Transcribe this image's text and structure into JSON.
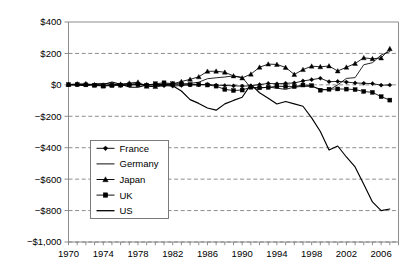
{
  "chart_data": {
    "type": "line",
    "title": "",
    "subtitle": "",
    "xlabel": "",
    "ylabel": "",
    "xlim": [
      1970,
      2008
    ],
    "ylim": [
      -1000,
      400
    ],
    "ytick_values": [
      400,
      200,
      0,
      -200,
      -400,
      -600,
      -800,
      -1000
    ],
    "ytick_labels": [
      "$400",
      "$200",
      "$0",
      "−$200",
      "−$400",
      "−$600",
      "−$800",
      "−$1,000"
    ],
    "xtick_labels": [
      "1970",
      "1974",
      "1978",
      "1982",
      "1986",
      "1990",
      "1994",
      "1998",
      "2002",
      "2006"
    ],
    "xtick_values": [
      1970,
      1974,
      1978,
      1982,
      1986,
      1990,
      1994,
      1998,
      2002,
      2006
    ],
    "minor_xtick_step": 1,
    "grid": "horizontal-dashed",
    "legend_position": "lower-left-inside",
    "x": [
      1970,
      1971,
      1972,
      1973,
      1974,
      1975,
      1976,
      1977,
      1978,
      1979,
      1980,
      1981,
      1982,
      1983,
      1984,
      1985,
      1986,
      1987,
      1988,
      1989,
      1990,
      1991,
      1992,
      1993,
      1994,
      1995,
      1996,
      1997,
      1998,
      1999,
      2000,
      2001,
      2002,
      2003,
      2004,
      2005,
      2006,
      2007
    ],
    "series": [
      {
        "name": "France",
        "marker": "diamond",
        "values": [
          0,
          1,
          1,
          0,
          -2,
          0,
          -3,
          -1,
          3,
          2,
          -3,
          -5,
          -8,
          -4,
          -1,
          0,
          4,
          -2,
          -4,
          -6,
          -8,
          -6,
          2,
          9,
          7,
          10,
          12,
          25,
          33,
          42,
          20,
          22,
          18,
          12,
          10,
          8,
          -2,
          -1
        ]
      },
      {
        "name": "Germany",
        "marker": "none",
        "values": [
          0,
          0,
          1,
          4,
          10,
          4,
          4,
          4,
          9,
          -6,
          -14,
          -5,
          5,
          5,
          9,
          17,
          39,
          45,
          50,
          57,
          48,
          -19,
          -20,
          -14,
          -21,
          -29,
          -14,
          -10,
          -9,
          -27,
          -33,
          0,
          41,
          46,
          128,
          141,
          190,
          212
        ]
      },
      {
        "name": "Japan",
        "marker": "triangle",
        "values": [
          2,
          6,
          7,
          0,
          -5,
          -1,
          4,
          11,
          17,
          -9,
          -11,
          5,
          7,
          21,
          35,
          51,
          86,
          87,
          80,
          57,
          44,
          68,
          112,
          132,
          130,
          111,
          66,
          97,
          119,
          115,
          120,
          88,
          112,
          136,
          172,
          166,
          171,
          230
        ]
      },
      {
        "name": "UK",
        "marker": "square",
        "values": [
          2,
          2,
          0,
          -3,
          -8,
          -4,
          -2,
          0,
          1,
          -2,
          7,
          13,
          7,
          5,
          2,
          3,
          -1,
          -8,
          -29,
          -36,
          -33,
          -15,
          -19,
          -16,
          -9,
          -11,
          -11,
          -1,
          -5,
          -34,
          -28,
          -26,
          -27,
          -30,
          -42,
          -48,
          -75,
          -97
        ]
      },
      {
        "name": "US",
        "marker": "none",
        "values": [
          2,
          -1,
          -6,
          7,
          2,
          18,
          4,
          -14,
          -15,
          -1,
          2,
          5,
          -5,
          -39,
          -94,
          -118,
          -147,
          -161,
          -121,
          -99,
          -79,
          3,
          -50,
          -85,
          -122,
          -106,
          -121,
          -136,
          -210,
          -297,
          -414,
          -389,
          -459,
          -522,
          -632,
          -745,
          -800,
          -790
        ]
      }
    ]
  },
  "legend": {
    "items": [
      {
        "label": "France",
        "marker": "diamond"
      },
      {
        "label": "Germany",
        "marker": "none"
      },
      {
        "label": "Japan",
        "marker": "triangle"
      },
      {
        "label": "UK",
        "marker": "square"
      },
      {
        "label": "US",
        "marker": "none"
      }
    ]
  },
  "colors": {
    "line": "#000000",
    "grid": "#808080",
    "axis": "#808080",
    "background": "#ffffff"
  }
}
